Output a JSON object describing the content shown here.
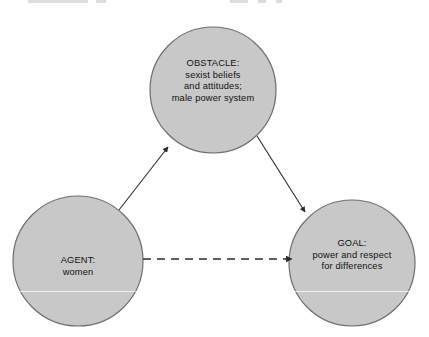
{
  "diagram": {
    "type": "triangle-model-diagram",
    "background_color": "#ffffff",
    "node_fill_color": "#c8c8c8",
    "node_stroke_color": "#6f6f6f",
    "connector_color": "#2b2b2b",
    "nodes": [
      {
        "id": "obstacle",
        "title": "OBSTACLE:",
        "lines": [
          "sexist beliefs",
          "and attitudes;",
          "male power system"
        ],
        "cx": 213,
        "cy": 90,
        "r": 63
      },
      {
        "id": "agent",
        "title": "AGENT:",
        "lines": [
          "women"
        ],
        "cx": 78,
        "cy": 261,
        "r": 65
      },
      {
        "id": "goal",
        "title": "GOAL:",
        "lines": [
          "power and respect",
          "for differences"
        ],
        "cx": 352,
        "cy": 263,
        "r": 63
      }
    ],
    "connectors": [
      {
        "id": "agent-to-obstacle",
        "from": "agent",
        "to": "obstacle",
        "style": "solid",
        "arrow": "end"
      },
      {
        "id": "obstacle-to-goal",
        "from": "obstacle",
        "to": "goal",
        "style": "solid",
        "arrow": "end"
      },
      {
        "id": "agent-to-goal",
        "from": "agent",
        "to": "goal",
        "style": "dashed",
        "arrow": "end"
      }
    ]
  }
}
